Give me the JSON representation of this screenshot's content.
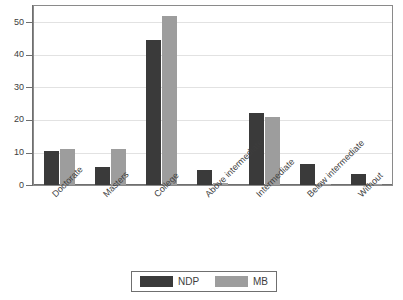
{
  "chart_data": {
    "type": "bar",
    "title": "",
    "subtitle": "",
    "xlabel": "",
    "ylabel": "",
    "ylim": [
      0,
      55
    ],
    "yticks": [
      0,
      10,
      20,
      30,
      40,
      50
    ],
    "grid": true,
    "legend_position": "bottom",
    "categories": [
      "Doctorate",
      "Masters",
      "College",
      "Above intermediate",
      "Intermediate",
      "Below intermediate",
      "Without"
    ],
    "series": [
      {
        "name": "NDP",
        "color": "#3a3a3a",
        "values": [
          10.5,
          5.5,
          44.5,
          4.5,
          22.0,
          6.5,
          3.5
        ]
      },
      {
        "name": "MB",
        "color": "#9d9d9d",
        "values": [
          11.2,
          11.0,
          51.8,
          0.5,
          21.0,
          0.4,
          0.3
        ]
      }
    ]
  },
  "axis": {
    "y_tick_labels": [
      "0",
      "10",
      "20",
      "30",
      "40",
      "50"
    ]
  },
  "legend": {
    "entries": [
      {
        "label": "NDP",
        "color": "#3a3a3a"
      },
      {
        "label": "MB",
        "color": "#9d9d9d"
      }
    ]
  }
}
